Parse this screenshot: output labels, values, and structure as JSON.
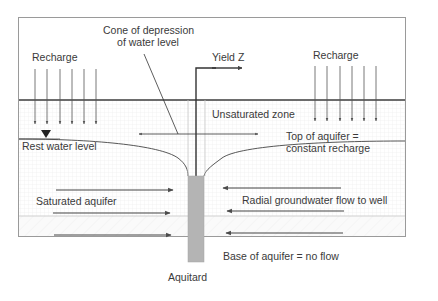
{
  "diagram": {
    "title_labels": {
      "cone": [
        "Cone of depression",
        "of water level"
      ],
      "yield": "Yield Z",
      "recharge_left": "Recharge",
      "recharge_right": "Recharge",
      "unsaturated_zone": "Unsaturated zone",
      "rest_water_level": "Rest water level",
      "top_of_aquifer": [
        "Top of aquifer =",
        "constant recharge"
      ],
      "saturated_aquifer": "Saturated aquifer",
      "radial_flow": "Radial groundwater flow to well",
      "base_of_aquifer": "Base of aquifer = no flow",
      "aquitard": "Aquitard"
    },
    "colors": {
      "frame": "#9a9a9a",
      "ground_line": "#3c3c3c",
      "arrow": "#4a4a4a",
      "well_screen": "#b4b4b4",
      "grid": "#e6e6e6",
      "text": "#3a3a3a"
    },
    "recharge_arrows_left": 6,
    "recharge_arrows_right": 6,
    "flow_arrows_left": 3,
    "flow_arrows_right": 3
  }
}
